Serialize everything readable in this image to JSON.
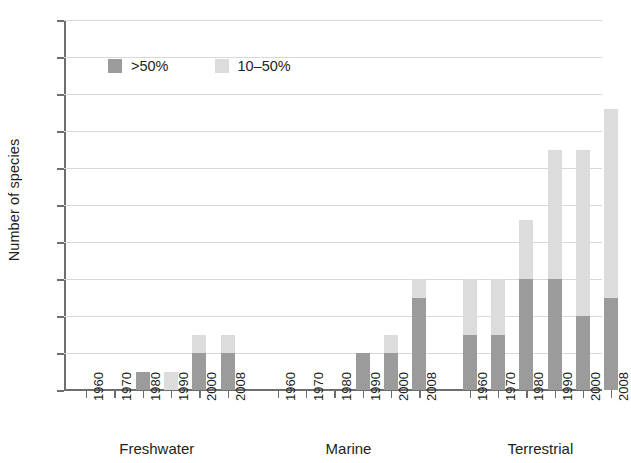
{
  "chart_data": {
    "type": "bar",
    "title": "",
    "subtitle": "",
    "xlabel": "",
    "ylabel": "Number of species",
    "ylim": [
      0,
      20
    ],
    "ytick_step": 2,
    "yticks": [
      0,
      2,
      4,
      6,
      8,
      10,
      12,
      14,
      16,
      18,
      20
    ],
    "grid": true,
    "stacked": true,
    "legend_position": "upper-left-inside",
    "categories": [
      "1960",
      "1970",
      "1980",
      "1990",
      "2000",
      "2008"
    ],
    "groups": [
      "Freshwater",
      "Marine",
      "Terrestrial"
    ],
    "series": [
      {
        "name": ">50%",
        "color": "#9b9b9b",
        "values_by_group": {
          "Freshwater": [
            0,
            0,
            1,
            0,
            2,
            2
          ],
          "Marine": [
            0,
            0,
            0,
            2,
            2,
            5
          ],
          "Terrestrial": [
            3,
            3,
            6,
            6,
            4,
            5
          ]
        }
      },
      {
        "name": "10–50%",
        "color": "#dcdcdc",
        "values_by_group": {
          "Freshwater": [
            0,
            0,
            0,
            1,
            1,
            1
          ],
          "Marine": [
            0,
            0,
            0,
            0,
            1,
            1
          ],
          "Terrestrial": [
            3,
            3,
            3.2,
            7,
            9,
            10.2
          ]
        }
      }
    ],
    "totals_by_group": {
      "Freshwater": [
        0,
        0,
        1,
        1,
        3,
        3
      ],
      "Marine": [
        0,
        0,
        0,
        2,
        3,
        6
      ],
      "Terrestrial": [
        6,
        6,
        9.2,
        13,
        13,
        15.2
      ]
    }
  },
  "legend": {
    "items": [
      {
        "label": ">50%",
        "color": "#9b9b9b",
        "swatch": "square-swatch-dark"
      },
      {
        "label": "10–50%",
        "color": "#dcdcdc",
        "swatch": "square-swatch-light"
      }
    ]
  },
  "axes": {
    "y_title": "Number of species"
  }
}
